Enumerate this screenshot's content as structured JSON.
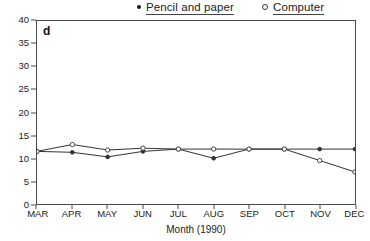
{
  "panel": {
    "label": "d"
  },
  "legend": {
    "position": "top",
    "entries": [
      {
        "label": "Pencil and paper",
        "marker": "filled-circle-icon"
      },
      {
        "label": "Computer",
        "marker": "open-circle-icon"
      }
    ]
  },
  "axes": {
    "xlabel": "Month (1990)",
    "ylabel": "",
    "yticks": [
      0,
      5,
      10,
      15,
      20,
      25,
      30,
      35,
      40
    ],
    "xticks": [
      "MAR",
      "APR",
      "MAY",
      "JUN",
      "JUL",
      "AUG",
      "SEP",
      "OCT",
      "NOV",
      "DEC"
    ]
  },
  "colors": {
    "line": "#333333",
    "frame": "#4a4a4a",
    "text": "#1a1a1a",
    "background": "#ffffff"
  },
  "chart_data": {
    "type": "line",
    "title": "",
    "subtitle": "",
    "xlabel": "Month (1990)",
    "ylabel": "",
    "categories": [
      "MAR",
      "APR",
      "MAY",
      "JUN",
      "JUL",
      "AUG",
      "SEP",
      "OCT",
      "NOV",
      "DEC"
    ],
    "series": [
      {
        "name": "Pencil and paper",
        "marker": "filled-circle",
        "values": [
          11.5,
          11.3,
          10.3,
          11.5,
          12.0,
          10.0,
          12.0,
          12.0,
          12.0,
          12.0
        ]
      },
      {
        "name": "Computer",
        "marker": "open-circle",
        "values": [
          11.5,
          13.0,
          11.8,
          12.2,
          12.0,
          12.0,
          12.0,
          12.0,
          9.5,
          7.0
        ]
      }
    ],
    "ylim": [
      0,
      40
    ],
    "grid": false,
    "legend_position": "top"
  }
}
